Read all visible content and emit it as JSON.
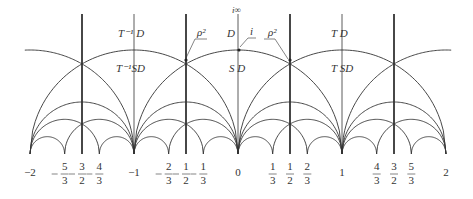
{
  "diagram": {
    "geometry": {
      "origin_x": 238,
      "baseline_y": 154,
      "unit_px": 104,
      "top_y": 14,
      "stroke_color": "#333333"
    },
    "region_labels": {
      "t_inv_d": "T⁻¹ D",
      "t_inv_sd": "T⁻¹SD",
      "d": "D",
      "s_d": "S D",
      "t_d": "T D",
      "t_sd": "T SD"
    },
    "point_labels": {
      "i_infinity": "i∞",
      "i": "i",
      "rho2_left": "ρ²",
      "rho2_right": "ρ²"
    },
    "axis_ticks": [
      {
        "value": -2,
        "num": "−2",
        "den": "",
        "neg": false
      },
      {
        "value": -1.6667,
        "num": "5",
        "den": "3",
        "neg": true
      },
      {
        "value": -1.5,
        "num": "3",
        "den": "2",
        "neg": true
      },
      {
        "value": -1.3333,
        "num": "4",
        "den": "3",
        "neg": true
      },
      {
        "value": -1,
        "num": "−1",
        "den": "",
        "neg": false
      },
      {
        "value": -0.6667,
        "num": "2",
        "den": "3",
        "neg": true
      },
      {
        "value": -0.5,
        "num": "1",
        "den": "2",
        "neg": true
      },
      {
        "value": -0.3333,
        "num": "1",
        "den": "3",
        "neg": true
      },
      {
        "value": 0,
        "num": "0",
        "den": "",
        "neg": false
      },
      {
        "value": 0.3333,
        "num": "1",
        "den": "3",
        "neg": false
      },
      {
        "value": 0.5,
        "num": "1",
        "den": "2",
        "neg": false
      },
      {
        "value": 0.6667,
        "num": "2",
        "den": "3",
        "neg": false
      },
      {
        "value": 1,
        "num": "1",
        "den": "",
        "neg": false
      },
      {
        "value": 1.3333,
        "num": "4",
        "den": "3",
        "neg": false
      },
      {
        "value": 1.5,
        "num": "3",
        "den": "2",
        "neg": false
      },
      {
        "value": 1.6667,
        "num": "5",
        "den": "3",
        "neg": false
      },
      {
        "value": 2,
        "num": "2",
        "den": "",
        "neg": false
      }
    ]
  }
}
